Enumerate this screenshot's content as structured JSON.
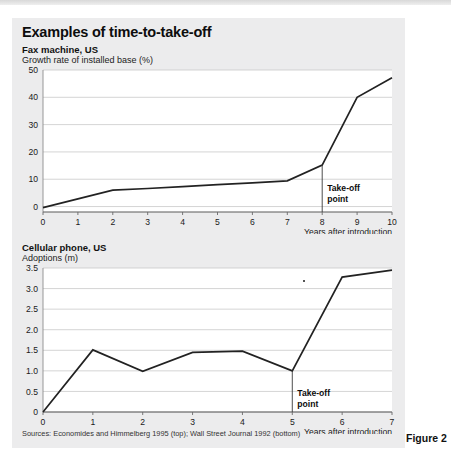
{
  "panel": {
    "title": "Examples of time-to-take-off",
    "sources": "Sources: Economides and Himmelberg 1995 (top); Wall Street Journal 1992 (bottom)",
    "figure_caption": "Figure 2",
    "background_color": "#ececed",
    "line_color": "#222222",
    "grid_color": "#c9c9c9"
  },
  "chart_data": [
    {
      "type": "line",
      "title": "Fax machine, US",
      "ylabel": "Growth rate of installed base (%)",
      "xlabel": "Years after introduction",
      "x": [
        0,
        1,
        2,
        3,
        4,
        5,
        6,
        7,
        8,
        9,
        10
      ],
      "values": [
        -0.4,
        2.8,
        6.0,
        6.6,
        7.3,
        8.0,
        8.7,
        9.4,
        15.2,
        40.0,
        47.2
      ],
      "xticks": [
        "0",
        "1",
        "2",
        "3",
        "4",
        "5",
        "6",
        "7",
        "8",
        "9",
        "10"
      ],
      "yticks": [
        "0",
        "10",
        "20",
        "30",
        "40",
        "50"
      ],
      "ytickvalues": [
        0,
        10,
        20,
        30,
        40,
        50
      ],
      "xlim": [
        0,
        10
      ],
      "ylim": [
        -2,
        50
      ],
      "grid": true,
      "annotation": {
        "label_line1": "Take-off",
        "label_line2": "point",
        "x": 8,
        "y": 15.2
      }
    },
    {
      "type": "line",
      "title": "Cellular phone, US",
      "ylabel": "Adoptions (m)",
      "xlabel": "Years after introduction",
      "x": [
        0,
        1,
        2,
        3,
        4,
        5,
        6,
        7
      ],
      "values": [
        0.0,
        1.51,
        0.99,
        1.45,
        1.48,
        1.0,
        3.28,
        3.45
      ],
      "xticks": [
        "0",
        "1",
        "2",
        "3",
        "4",
        "5",
        "6",
        "7"
      ],
      "yticks": [
        "0",
        "0.5",
        "1.0",
        "1.5",
        "2.0",
        "2.5",
        "3.0",
        "3.5"
      ],
      "ytickvalues": [
        0,
        0.5,
        1.0,
        1.5,
        2.0,
        2.5,
        3.0,
        3.5
      ],
      "xlim": [
        0,
        7
      ],
      "ylim": [
        0,
        3.5
      ],
      "grid": true,
      "annotation": {
        "label_line1": "Take-off",
        "label_line2": "point",
        "x": 5,
        "y": 1.0
      }
    }
  ]
}
